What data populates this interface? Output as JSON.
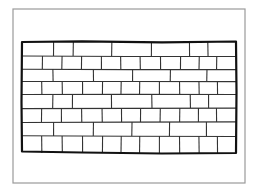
{
  "image": {
    "width": 256,
    "height": 192,
    "background": "#ffffff"
  },
  "frame": {
    "x": 13,
    "y": 9,
    "width": 232,
    "height": 174,
    "stroke": "#9a9a9a",
    "stroke_width": 1.2
  },
  "wall": {
    "x": 22,
    "y": 42,
    "width": 214,
    "height": 112,
    "outline_stroke": "#111111",
    "outline_width": 2.2,
    "mortar_stroke": "#333333",
    "mortar_width": 1.1,
    "rows": [
      {
        "y0": 42,
        "y1": 56,
        "joints": [
          53,
          73,
          112,
          152,
          190,
          208
        ]
      },
      {
        "y0": 56,
        "y1": 69,
        "joints": [
          42,
          62,
          82,
          102,
          121,
          140,
          160,
          180,
          199,
          217
        ]
      },
      {
        "y0": 69,
        "y1": 82,
        "joints": [
          53,
          93,
          132,
          170,
          207
        ]
      },
      {
        "y0": 82,
        "y1": 95,
        "joints": [
          42,
          62,
          82,
          102,
          121,
          140,
          160,
          180,
          199,
          217
        ]
      },
      {
        "y0": 95,
        "y1": 108,
        "joints": [
          53,
          73,
          112,
          152,
          190,
          208
        ]
      },
      {
        "y0": 108,
        "y1": 122,
        "joints": [
          42,
          62,
          82,
          102,
          121,
          140,
          160,
          180,
          199,
          217
        ]
      },
      {
        "y0": 122,
        "y1": 136,
        "joints": [
          53,
          93,
          132,
          170,
          207
        ]
      },
      {
        "y0": 136,
        "y1": 153,
        "joints": [
          42,
          62,
          82,
          102,
          121,
          140,
          160,
          180,
          199,
          217
        ]
      }
    ]
  }
}
